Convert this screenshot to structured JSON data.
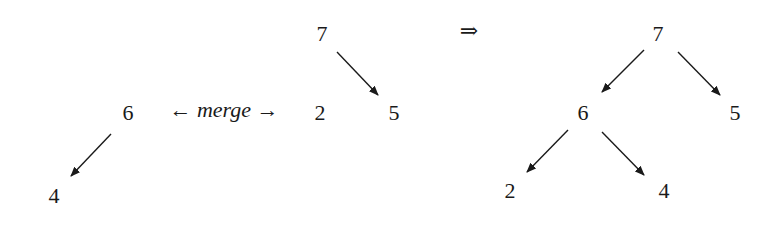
{
  "left": {
    "heap_a": {
      "root": "6",
      "children": [
        "4"
      ]
    },
    "operator": {
      "left_arrow": "←",
      "label": "merge",
      "right_arrow": "→"
    },
    "heap_b": {
      "root": "7",
      "children": [
        "2",
        "5"
      ],
      "orphan": "2"
    }
  },
  "implies": "⇒",
  "right": {
    "root": "7",
    "level1": [
      "6",
      "5"
    ],
    "level2": [
      "2",
      "4"
    ]
  },
  "colors": {
    "ink": "#1a1a1a",
    "background": "#ffffff"
  }
}
